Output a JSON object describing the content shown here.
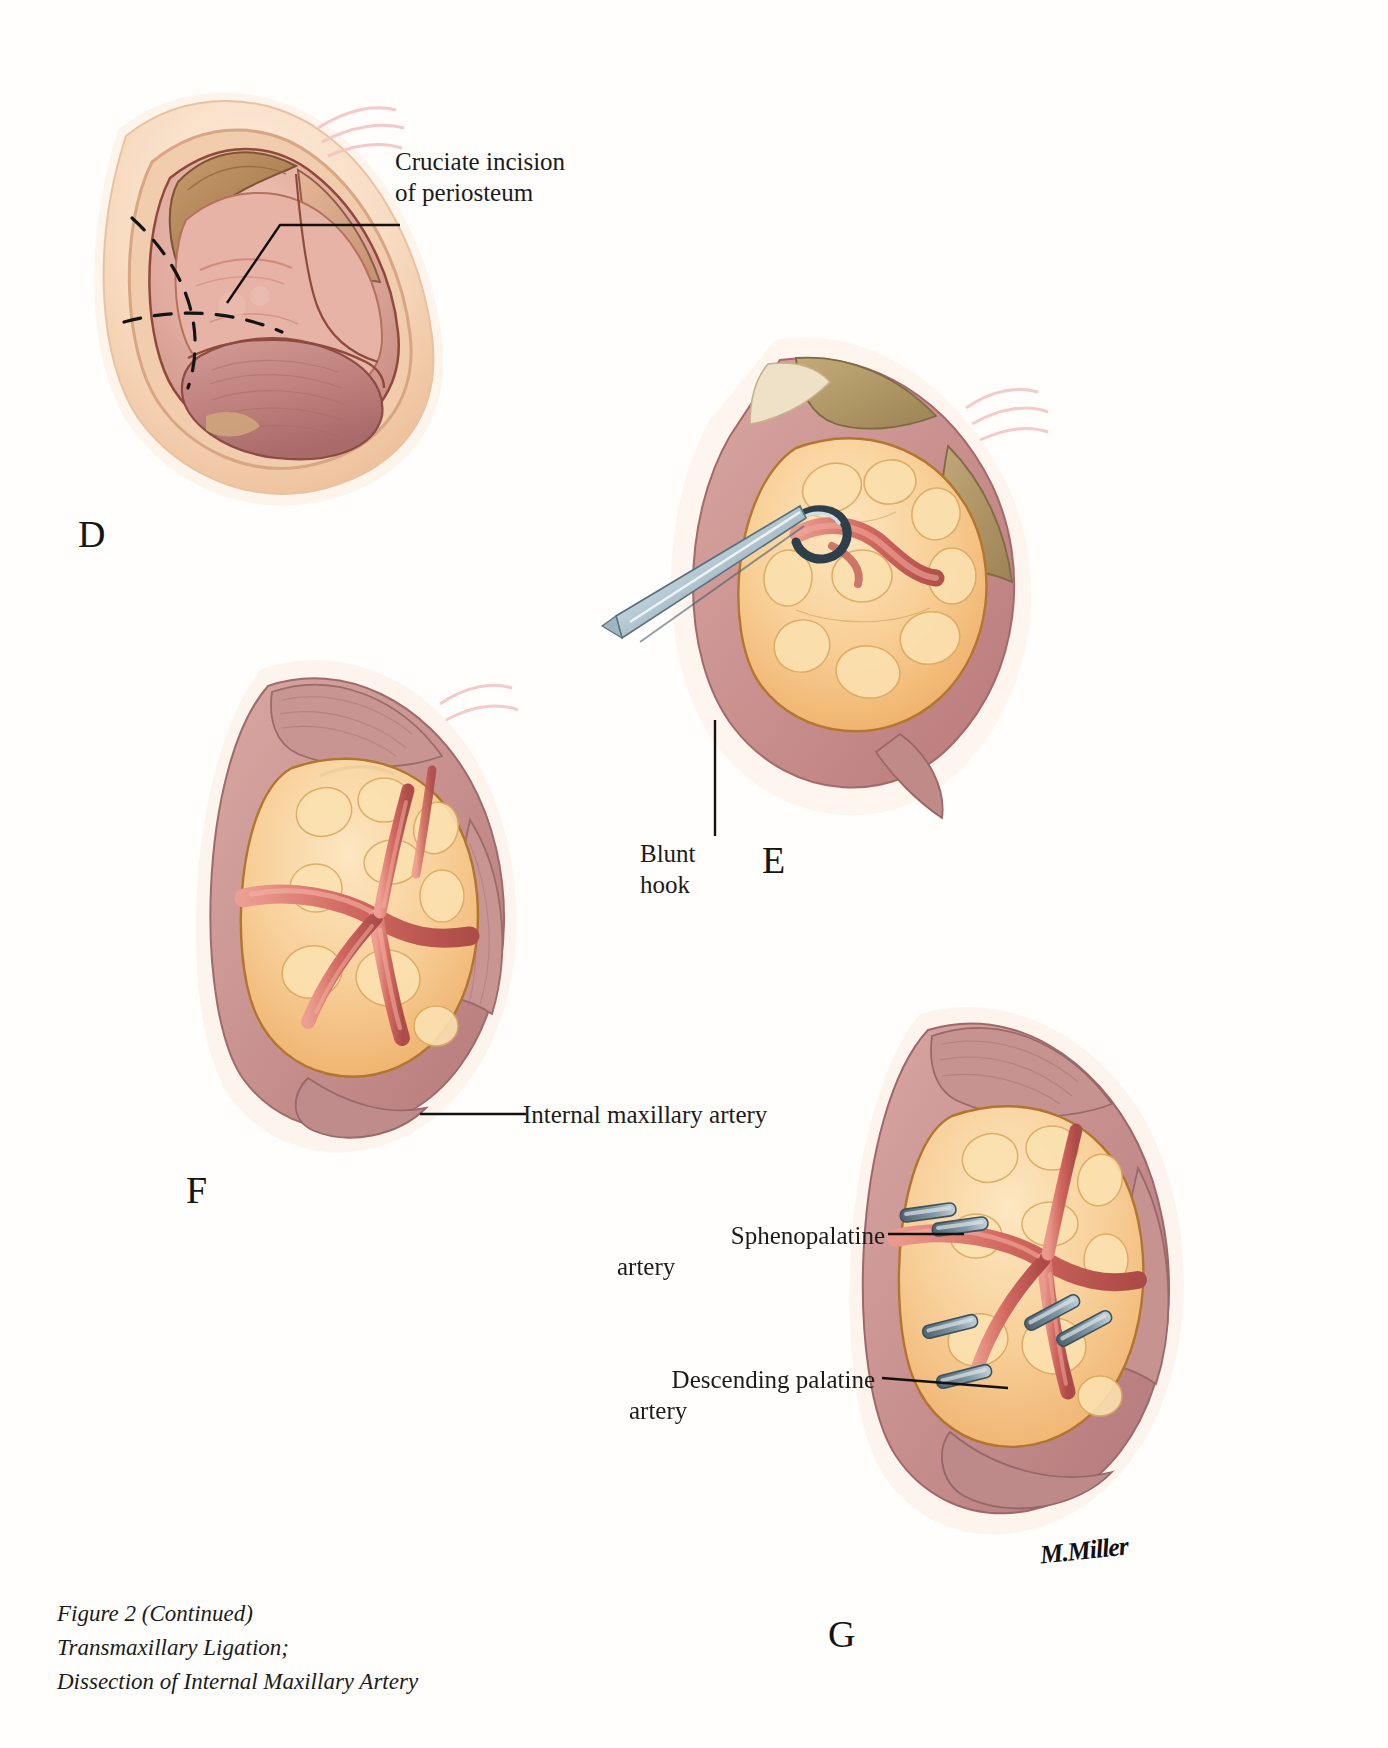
{
  "figure": {
    "caption_lines": [
      "Figure 2 (Continued)",
      "Transmaxillary Ligation;",
      "Dissection of Internal Maxillary Artery"
    ],
    "signature": "M.Miller"
  },
  "panels": [
    {
      "id": "D",
      "letter": "D",
      "letter_pos": {
        "x": 78,
        "y": 512
      },
      "labels": [
        {
          "name": "cruciate-incision-label",
          "lines": [
            "Cruciate incision",
            "of periosteum"
          ],
          "x": 395,
          "y": 148,
          "align": "left"
        }
      ]
    },
    {
      "id": "E",
      "letter": "E",
      "letter_pos": {
        "x": 762,
        "y": 838
      },
      "labels": [
        {
          "name": "blunt-hook-label",
          "lines": [
            "Blunt",
            "hook"
          ],
          "x": 640,
          "y": 840,
          "align": "left"
        }
      ]
    },
    {
      "id": "F",
      "letter": "F",
      "letter_pos": {
        "x": 186,
        "y": 1168
      },
      "labels": [
        {
          "name": "internal-maxillary-artery-label",
          "lines": [
            "Internal maxillary artery"
          ],
          "x": 523,
          "y": 1098,
          "align": "left"
        }
      ]
    },
    {
      "id": "G",
      "letter": "G",
      "letter_pos": {
        "x": 828,
        "y": 1612
      },
      "labels": [
        {
          "name": "sphenopalatine-artery-label",
          "lines": [
            "Sphenopalatine",
            "artery"
          ],
          "x": 617,
          "y": 1222,
          "align": "left"
        },
        {
          "name": "descending-palatine-artery-label",
          "lines": [
            "Descending palatine",
            "artery"
          ],
          "x": 629,
          "y": 1366,
          "align": "left"
        }
      ]
    }
  ],
  "colors": {
    "ink": "#1b1b1b",
    "leader": "#111111",
    "skin_light": "#f7dcc4",
    "skin_mid": "#eebf9c",
    "mucosa": "#d89a91",
    "muscle": "#b8736f",
    "fat_pad": "#f6c98a",
    "artery": "#d9756b",
    "clip_metal": "#7d909a",
    "retractor": "#9fb6c2",
    "outline": "#6e3b28"
  }
}
